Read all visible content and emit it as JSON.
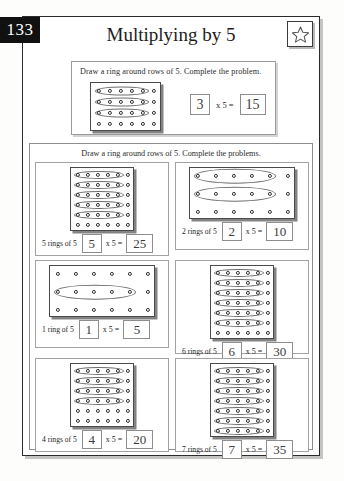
{
  "page": {
    "number": "133",
    "title": "Multiplying by 5",
    "star_icon": "star-icon"
  },
  "example": {
    "instruction": "Draw a ring around rows of 5. Complete the problem.",
    "grid": {
      "rows": 4,
      "cols": 6,
      "rings": 3
    },
    "factor": "3",
    "operator": "x 5 =",
    "product": "15"
  },
  "main": {
    "instruction": "Draw a ring around rows of 5. Complete the problems.",
    "problems": [
      {
        "id": "problem-1",
        "grid": {
          "rows": 6,
          "cols": 6,
          "rings": 5
        },
        "label": "5 rings of 5",
        "factor": "5",
        "operator": "x  5  =",
        "product": "25"
      },
      {
        "id": "problem-2",
        "grid": {
          "rows": 3,
          "cols": 6,
          "rings": 2
        },
        "label": "2 rings of 5",
        "factor": "2",
        "operator": "x  5  =",
        "product": "10"
      },
      {
        "id": "problem-3",
        "grid": {
          "rows": 3,
          "cols": 6,
          "rings": 1,
          "ring_rows": [
            1
          ]
        },
        "label": "1 ring of 5",
        "factor": "1",
        "operator": "x  5  =",
        "product": "5"
      },
      {
        "id": "problem-4",
        "grid": {
          "rows": 7,
          "cols": 6,
          "rings": 6
        },
        "label": "6 rings of 5",
        "factor": "6",
        "operator": "x  5  =",
        "product": "30"
      },
      {
        "id": "problem-5",
        "grid": {
          "rows": 6,
          "cols": 6,
          "rings": 4
        },
        "label": "4 rings of 5",
        "factor": "4",
        "operator": "x  5  =",
        "product": "20"
      },
      {
        "id": "problem-6",
        "grid": {
          "rows": 7,
          "cols": 6,
          "rings": 7
        },
        "label": "7 rings of 5",
        "factor": "7",
        "operator": "x  5  =",
        "product": "35"
      }
    ]
  },
  "colors": {
    "ink": "#2a2a2a",
    "tab_background": "#111111",
    "tab_text": "#ffffff",
    "grid_border": "#4a4a4a",
    "ring_stroke": "#6d6d6d",
    "box_border": "#8d8d8d"
  }
}
